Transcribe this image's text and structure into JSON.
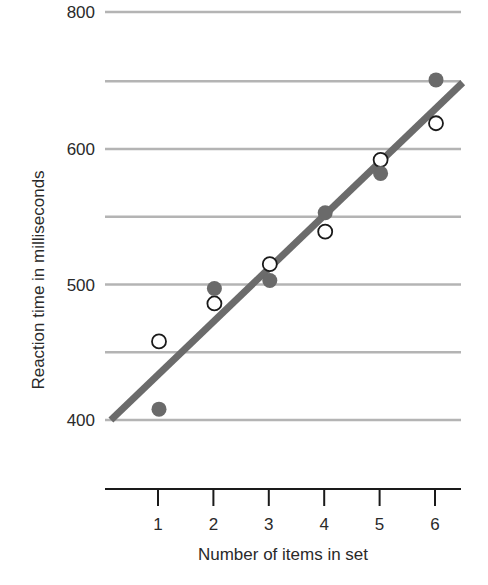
{
  "chart_data": {
    "type": "scatter",
    "title": "",
    "xlabel": "Number of items in set",
    "ylabel": "Reaction time in milliseconds",
    "x": [
      1,
      2,
      3,
      4,
      5,
      6
    ],
    "x_tick_labels": [
      "1",
      "2",
      "3",
      "4",
      "5",
      "6"
    ],
    "y_tick_labels": [
      "400",
      "500",
      "600",
      "800"
    ],
    "y_gridlines": [
      400,
      450,
      500,
      550,
      600,
      650,
      800
    ],
    "ylim": [
      400,
      800
    ],
    "y_axis_break": "scale is continuous from 400 to 650; 800 line drawn above as a truncated top",
    "grid": true,
    "legend": null,
    "series": [
      {
        "name": "open circles",
        "marker": "open-circle",
        "values": [
          458,
          486,
          515,
          539,
          592,
          619
        ]
      },
      {
        "name": "filled circles",
        "marker": "filled-circle",
        "values": [
          408,
          497,
          503,
          553,
          582,
          651
        ]
      }
    ],
    "fit_line": {
      "type": "linear",
      "x_start": 0.15,
      "y_start": 400,
      "x_end": 6.5,
      "y_end": 649
    },
    "colors": {
      "gridline": "#b4b4b4",
      "fit_line": "#6b6b6b",
      "filled_marker": "#6a6a6a",
      "open_marker_stroke": "#1a1a1a",
      "axis": "#1a1a1a",
      "text": "#2a2a2a"
    }
  }
}
